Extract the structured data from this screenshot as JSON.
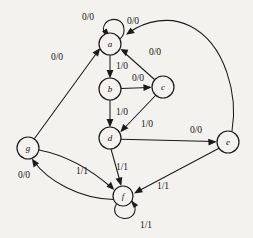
{
  "diagram": {
    "type": "state-transition-graph",
    "notation": "input/output",
    "canvas": {
      "width": 253,
      "height": 238
    },
    "background_color": "#f4f2ee",
    "stroke_color": "#1b1b1b",
    "states": [
      {
        "id": "a",
        "label": "a",
        "cx": 110,
        "cy": 44,
        "r": 11
      },
      {
        "id": "b",
        "label": "b",
        "cx": 110,
        "cy": 89,
        "r": 11
      },
      {
        "id": "c",
        "label": "c",
        "cx": 163,
        "cy": 87,
        "r": 11
      },
      {
        "id": "d",
        "label": "d",
        "cx": 110,
        "cy": 138,
        "r": 11
      },
      {
        "id": "e",
        "label": "e",
        "cx": 228,
        "cy": 142,
        "r": 11
      },
      {
        "id": "f",
        "label": "f",
        "cx": 123,
        "cy": 196,
        "r": 10
      },
      {
        "id": "g",
        "label": "g",
        "cx": 28,
        "cy": 148,
        "r": 11
      }
    ],
    "transitions": [
      {
        "from": "a",
        "to": "a",
        "label": "0/0",
        "label_x": 88,
        "label_y": 18,
        "kind": "self-loop-top"
      },
      {
        "from": "a",
        "to": "b",
        "label": "1/0",
        "label_x": 122,
        "label_y": 67,
        "kind": "straight"
      },
      {
        "from": "b",
        "to": "c",
        "label": "0/0",
        "label_x": 138,
        "label_y": 80,
        "kind": "straight"
      },
      {
        "from": "b",
        "to": "d",
        "label": "1/0",
        "label_x": 122,
        "label_y": 113,
        "kind": "straight"
      },
      {
        "from": "c",
        "to": "a",
        "label": "0/0",
        "label_x": 153,
        "label_y": 53,
        "kind": "straight"
      },
      {
        "from": "c",
        "to": "d",
        "label": "1/0",
        "label_x": 146,
        "label_y": 125,
        "kind": "straight"
      },
      {
        "from": "d",
        "to": "e",
        "label": "0/0",
        "label_x": 196,
        "label_y": 131,
        "kind": "straight"
      },
      {
        "from": "d",
        "to": "f",
        "label": "1/1",
        "label_x": 122,
        "label_y": 168,
        "kind": "straight"
      },
      {
        "from": "e",
        "to": "a",
        "label": "0/0",
        "label_x": 133,
        "label_y": 22,
        "kind": "curve-over-top"
      },
      {
        "from": "e",
        "to": "f",
        "label": "1/1",
        "label_x": 162,
        "label_y": 186,
        "kind": "straight"
      },
      {
        "from": "f",
        "to": "f",
        "label": "1/1",
        "label_x": 145,
        "label_y": 226,
        "kind": "self-loop-bottom"
      },
      {
        "from": "f",
        "to": "g",
        "label": "0/0",
        "label_x": 24,
        "label_y": 176,
        "kind": "curve-lower"
      },
      {
        "from": "g",
        "to": "f",
        "label": "1/1",
        "label_x": 82,
        "label_y": 172,
        "kind": "curve-upper"
      },
      {
        "from": "g",
        "to": "a",
        "label": "0/0",
        "label_x": 58,
        "label_y": 58,
        "kind": "straight"
      }
    ]
  }
}
